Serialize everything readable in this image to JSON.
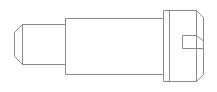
{
  "image": {
    "kind": "technical-line-drawing",
    "subject": "slotted-screw-side-view",
    "width": 217,
    "height": 92,
    "background_color": "#ffffff",
    "line_color": "#8a8a8a",
    "fill_color": "#ffffff",
    "line_width": 1
  },
  "drawing": {
    "title": "",
    "caption": "",
    "parts": [
      {
        "name": "dog-point-tip",
        "label": "",
        "description": "small chamfered cylindrical point at left end",
        "bounds": {
          "x": 14,
          "y": 24,
          "width": 52,
          "height": 41
        },
        "chamfer": 8
      },
      {
        "name": "shank",
        "label": "",
        "description": "main cylindrical body rectangle",
        "bounds": {
          "x": 65,
          "y": 18,
          "width": 99,
          "height": 56
        }
      },
      {
        "name": "head",
        "label": "",
        "description": "screw head with slot and right-side chamfer",
        "bounds": {
          "x": 163,
          "y": 10,
          "width": 41,
          "height": 72
        },
        "chamfer": 7
      },
      {
        "name": "screwdriver-slot",
        "label": "",
        "description": "horizontal drive slot cut into head",
        "bounds": {
          "x": 182,
          "y": 35,
          "width": 22,
          "height": 13
        }
      }
    ],
    "geometry": {
      "tip_polygon": "22,24 65,24 65,64 22,64 14,56 14,32",
      "tip_inner_line_top": "22,24 22,64",
      "shank_rect": {
        "x": 65,
        "y": 18,
        "width": 99,
        "height": 56
      },
      "head_outline": "163,10 197,10 204,17 204,75 197,82 163,82",
      "head_inner_vertical": "197,10 197,82",
      "slot_path": "182,35 197,35 197,48 182,48",
      "slot_right_extension": "197,35 204,41 204,48",
      "seam_left_of_head": "169,10 169,82"
    }
  }
}
